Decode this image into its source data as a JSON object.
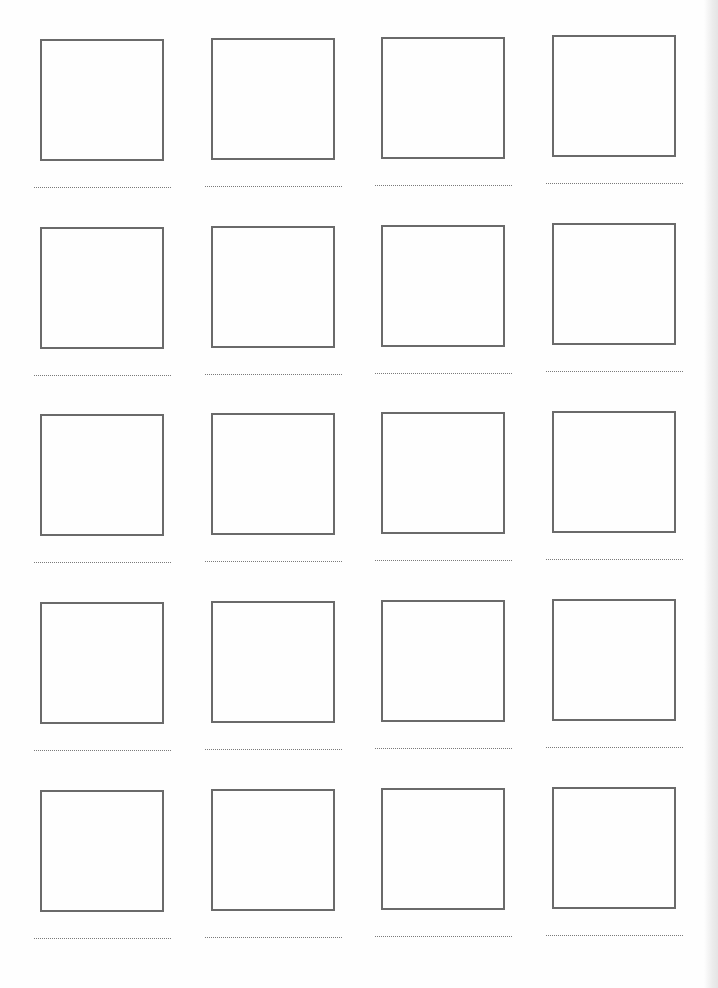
{
  "worksheet": {
    "layout": {
      "columns": 4,
      "rows": 5
    },
    "colors": {
      "frame_border": "#6a6a6a",
      "dotted_line": "#7a7a7a",
      "background": "#fefefe"
    },
    "cells": [
      {
        "row": 1,
        "col": 1,
        "x": 34,
        "y": 39
      },
      {
        "row": 1,
        "col": 2,
        "x": 205,
        "y": 38
      },
      {
        "row": 1,
        "col": 3,
        "x": 375,
        "y": 37
      },
      {
        "row": 1,
        "col": 4,
        "x": 546,
        "y": 35
      },
      {
        "row": 2,
        "col": 1,
        "x": 34,
        "y": 227
      },
      {
        "row": 2,
        "col": 2,
        "x": 205,
        "y": 226
      },
      {
        "row": 2,
        "col": 3,
        "x": 375,
        "y": 225
      },
      {
        "row": 2,
        "col": 4,
        "x": 546,
        "y": 223
      },
      {
        "row": 3,
        "col": 1,
        "x": 34,
        "y": 414
      },
      {
        "row": 3,
        "col": 2,
        "x": 205,
        "y": 413
      },
      {
        "row": 3,
        "col": 3,
        "x": 375,
        "y": 412
      },
      {
        "row": 3,
        "col": 4,
        "x": 546,
        "y": 411
      },
      {
        "row": 4,
        "col": 1,
        "x": 34,
        "y": 602
      },
      {
        "row": 4,
        "col": 2,
        "x": 205,
        "y": 601
      },
      {
        "row": 4,
        "col": 3,
        "x": 375,
        "y": 600
      },
      {
        "row": 4,
        "col": 4,
        "x": 546,
        "y": 599
      },
      {
        "row": 5,
        "col": 1,
        "x": 34,
        "y": 790
      },
      {
        "row": 5,
        "col": 2,
        "x": 205,
        "y": 789
      },
      {
        "row": 5,
        "col": 3,
        "x": 375,
        "y": 788
      },
      {
        "row": 5,
        "col": 4,
        "x": 546,
        "y": 787
      }
    ]
  }
}
